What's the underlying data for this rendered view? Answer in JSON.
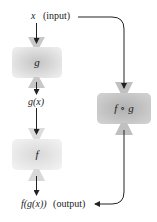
{
  "diagram": {
    "type": "function-composition",
    "input": {
      "var": "x",
      "note": "(input)"
    },
    "intermediate": {
      "label": "g(x)"
    },
    "output": {
      "label": "f(g(x))",
      "note": "(output)"
    },
    "machines": [
      {
        "id": "g",
        "label": "g",
        "color": "#cfcfcf"
      },
      {
        "id": "f",
        "label": "f",
        "color": "#dedede"
      },
      {
        "id": "fog",
        "label": "f ∘ g",
        "color": "#b9b9b9"
      }
    ]
  }
}
